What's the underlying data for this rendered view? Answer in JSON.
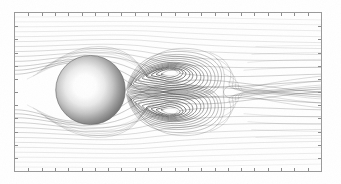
{
  "figure": {
    "subtitle": "Steady separated wake with symmetric counter-rotating recirculation vortices",
    "background_color": "#ffffff",
    "frame_color": "#9a9a9a",
    "streamline_color": "#555555",
    "body_shading_light": "#ffffff",
    "body_shading_dark": "#6d6d6d"
  },
  "frame": {
    "x": 14,
    "y": 12,
    "width": 308,
    "height": 160,
    "border_width": 1,
    "tick_count_x": 23,
    "tick_count_y": 12,
    "tick_length": 3,
    "tick_direction": "inward"
  },
  "chart_data": {
    "type": "line",
    "xlabel": "",
    "ylabel": "",
    "xlim": [
      -2.2,
      10.0
    ],
    "ylim": [
      -3.2,
      3.2
    ],
    "grid": false,
    "legend": "none",
    "body": {
      "shape": "circle",
      "center_x": 0.0,
      "center_y": 0.0,
      "radius": 1.0,
      "pixel_center_x": 90,
      "pixel_center_y": 90,
      "pixel_radius": 35,
      "shading": "radial-gradient-white-core"
    },
    "vortices": [
      {
        "name": "upper-recirculation-vortex",
        "rotation": "clockwise",
        "core_x": 2.1,
        "core_y": 0.78,
        "pixel_core_x": 162,
        "pixel_core_y": 65,
        "core_width": 16,
        "core_height": 6,
        "closed_streamline_count": 15
      },
      {
        "name": "lower-recirculation-vortex",
        "rotation": "counterclockwise",
        "core_x": 2.1,
        "core_y": -0.78,
        "pixel_core_x": 162,
        "pixel_core_y": 117,
        "core_width": 16,
        "core_height": 6,
        "closed_streamline_count": 15
      }
    ],
    "separation": {
      "wake_closure_x": 5.1,
      "wake_closure_pixel_x": 221,
      "separation_angle_deg": 118,
      "wake_length_diameters": 2.6
    },
    "series": [
      {
        "name": "streamline",
        "y0": -3.0,
        "strength": 0.04
      },
      {
        "name": "streamline",
        "y0": -2.7,
        "strength": 0.06
      },
      {
        "name": "streamline",
        "y0": -2.42,
        "strength": 0.08
      },
      {
        "name": "streamline",
        "y0": -2.15,
        "strength": 0.11
      },
      {
        "name": "streamline",
        "y0": -1.9,
        "strength": 0.15
      },
      {
        "name": "streamline",
        "y0": -1.66,
        "strength": 0.2
      },
      {
        "name": "streamline",
        "y0": -1.44,
        "strength": 0.26
      },
      {
        "name": "streamline",
        "y0": -1.24,
        "strength": 0.33
      },
      {
        "name": "streamline",
        "y0": -1.06,
        "strength": 0.41
      },
      {
        "name": "streamline",
        "y0": -0.9,
        "strength": 0.5
      },
      {
        "name": "streamline",
        "y0": -0.75,
        "strength": 0.58
      },
      {
        "name": "streamline",
        "y0": -0.62,
        "strength": 0.66
      },
      {
        "name": "streamline",
        "y0": -0.5,
        "strength": 0.73
      },
      {
        "name": "streamline",
        "y0": -0.39,
        "strength": 0.8
      },
      {
        "name": "streamline",
        "y0": -0.29,
        "strength": 0.86
      },
      {
        "name": "streamline",
        "y0": -0.2,
        "strength": 0.91
      },
      {
        "name": "streamline",
        "y0": -0.12,
        "strength": 0.95
      },
      {
        "name": "streamline",
        "y0": -0.05,
        "strength": 0.98
      },
      {
        "name": "streamline",
        "y0": 0.05,
        "strength": 0.98
      },
      {
        "name": "streamline",
        "y0": 0.12,
        "strength": 0.95
      },
      {
        "name": "streamline",
        "y0": 0.2,
        "strength": 0.91
      },
      {
        "name": "streamline",
        "y0": 0.29,
        "strength": 0.86
      },
      {
        "name": "streamline",
        "y0": 0.39,
        "strength": 0.8
      },
      {
        "name": "streamline",
        "y0": 0.5,
        "strength": 0.73
      },
      {
        "name": "streamline",
        "y0": 0.62,
        "strength": 0.66
      },
      {
        "name": "streamline",
        "y0": 0.75,
        "strength": 0.58
      },
      {
        "name": "streamline",
        "y0": 0.9,
        "strength": 0.5
      },
      {
        "name": "streamline",
        "y0": 1.06,
        "strength": 0.41
      },
      {
        "name": "streamline",
        "y0": 1.24,
        "strength": 0.33
      },
      {
        "name": "streamline",
        "y0": 1.44,
        "strength": 0.26
      },
      {
        "name": "streamline",
        "y0": 1.66,
        "strength": 0.2
      },
      {
        "name": "streamline",
        "y0": 1.9,
        "strength": 0.15
      },
      {
        "name": "streamline",
        "y0": 2.15,
        "strength": 0.11
      },
      {
        "name": "streamline",
        "y0": 2.42,
        "strength": 0.08
      },
      {
        "name": "streamline",
        "y0": 2.7,
        "strength": 0.06
      },
      {
        "name": "streamline",
        "y0": 3.0,
        "strength": 0.04
      }
    ]
  }
}
